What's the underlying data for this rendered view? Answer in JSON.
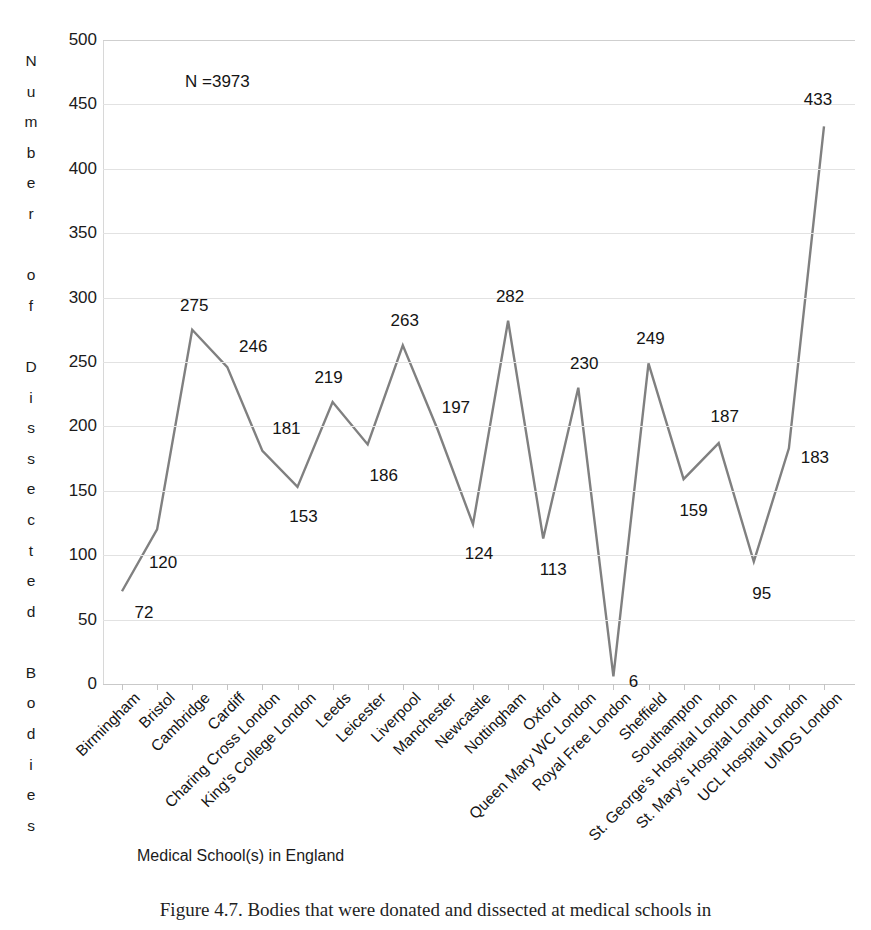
{
  "chart_data": {
    "type": "line",
    "title": "",
    "xlabel": "Medical School(s) in England",
    "ylabel": "Number of Dissected Bodies",
    "ylim": [
      0,
      500
    ],
    "ytick_step": 50,
    "yticks": [
      0,
      50,
      100,
      150,
      200,
      250,
      300,
      350,
      400,
      450,
      500
    ],
    "grid": true,
    "legend": "none",
    "annotation": "N =3973",
    "series_color": "#808080",
    "categories": [
      "Birmingham",
      "Bristol",
      "Cambridge",
      "Cardiff",
      "Charing Cross London",
      "King's College London",
      "Leeds",
      "Leicester",
      "Liverpool",
      "Manchester",
      "Newcastle",
      "Nottingham",
      "Oxford",
      "Queen Mary WC London",
      "Royal Free London",
      "Sheffield",
      "Southampton",
      "St. George's Hospital London",
      "St. Mary's Hospital London",
      "UCL Hospital London",
      "UMDS London"
    ],
    "values": [
      72,
      120,
      275,
      246,
      181,
      153,
      219,
      186,
      263,
      197,
      124,
      282,
      113,
      230,
      6,
      249,
      159,
      187,
      95,
      183,
      433
    ]
  },
  "axis": {
    "y_title_letters": "N\nu\nm\nb\ne\nr\n\no\nf\n\nD\ni\ns\ns\ne\nc\nt\ne\nd\n\nB\no\nd\ni\ne\ns",
    "y_tick_labels": [
      "500",
      "450",
      "400",
      "350",
      "300",
      "250",
      "200",
      "150",
      "100",
      "50",
      "0"
    ],
    "x_title": "Medical School(s) in England"
  },
  "annotation": {
    "sample_size": "N =3973"
  },
  "caption": {
    "text": "Figure 4.7. Bodies that were donated and dissected at medical schools in"
  },
  "value_labels": [
    "72",
    "120",
    "275",
    "246",
    "181",
    "153",
    "219",
    "186",
    "263",
    "197",
    "124",
    "282",
    "113",
    "230",
    "6",
    "249",
    "159",
    "187",
    "95",
    "183",
    "433"
  ]
}
